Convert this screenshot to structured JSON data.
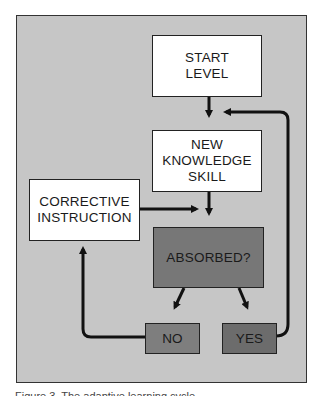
{
  "diagram": {
    "nodes": {
      "start": {
        "lines": [
          "START",
          "LEVEL"
        ]
      },
      "new_knowledge": {
        "lines": [
          "NEW",
          "KNOWLEDGE",
          "SKILL"
        ]
      },
      "corrective": {
        "lines": [
          "CORRECTIVE",
          "INSTRUCTION"
        ]
      },
      "absorbed": {
        "label": "ABSORBED?"
      },
      "no": {
        "label": "NO"
      },
      "yes": {
        "label": "YES"
      }
    },
    "edges": [
      {
        "from": "START LEVEL",
        "to": "NEW KNOWLEDGE SKILL"
      },
      {
        "from": "NEW KNOWLEDGE SKILL",
        "to": "ABSORBED?"
      },
      {
        "from": "CORRECTIVE INSTRUCTION",
        "to": "ABSORBED?"
      },
      {
        "from": "ABSORBED?",
        "to": "NO"
      },
      {
        "from": "ABSORBED?",
        "to": "YES"
      },
      {
        "from": "NO",
        "to": "CORRECTIVE INSTRUCTION"
      },
      {
        "from": "YES",
        "to": "NEW KNOWLEDGE SKILL"
      }
    ],
    "colors": {
      "panel": "#c6c6c6",
      "white_box": "#ffffff",
      "decision_box": "#777777",
      "no_box": "#7e7e7e",
      "yes_box": "#6c6c6c",
      "stroke": "#111111"
    }
  },
  "caption": {
    "text": "Figure 3. The adaptive learning cycle"
  }
}
